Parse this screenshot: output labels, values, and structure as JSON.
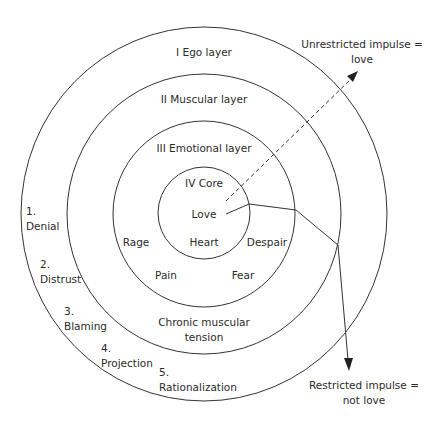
{
  "diagram": {
    "rings": [
      {
        "id": "ego",
        "label": "I Ego layer",
        "r": 184
      },
      {
        "id": "muscular",
        "label": "II Muscular layer",
        "r": 138
      },
      {
        "id": "emotional",
        "label": "III Emotional layer",
        "r": 92
      },
      {
        "id": "core",
        "label": "IV Core",
        "r": 46
      }
    ],
    "core_labels": {
      "love": "Love",
      "heart": "Heart"
    },
    "emotional_labels": {
      "rage": "Rage",
      "despair": "Despair",
      "pain": "Pain",
      "fear": "Fear"
    },
    "muscular_label": {
      "line1": "Chronic muscular",
      "line2": "tension"
    },
    "defenses": [
      {
        "num": "1.",
        "label": "Denial"
      },
      {
        "num": "2.",
        "label": "Distrust"
      },
      {
        "num": "3.",
        "label": "Blaming"
      },
      {
        "num": "4.",
        "label": "Projection"
      },
      {
        "num": "5.",
        "label": "Rationalization"
      }
    ],
    "unrestricted": {
      "line1": "Unrestricted impulse =",
      "line2": "love"
    },
    "restricted": {
      "line1": "Restricted impulse =",
      "line2": "not love"
    },
    "colors": {
      "stroke": "#333333",
      "text": "#2a2a2a",
      "background": "#ffffff"
    }
  }
}
